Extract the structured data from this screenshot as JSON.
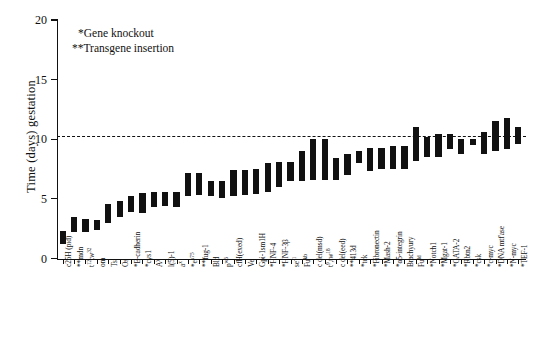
{
  "chart_data": {
    "type": "bar",
    "title": "",
    "xlabel": "",
    "ylabel": "Time (days) gestation",
    "ylim": [
      0,
      20
    ],
    "yticks": [
      0,
      5,
      10,
      15,
      20
    ],
    "grid": false,
    "legend_position": "upper-left-inside",
    "annotations": [
      "*Gene knockout",
      "**Transgene insertion"
    ],
    "reference_line": {
      "value": 10.3,
      "style": "dashed",
      "label": ""
    },
    "value_kind": "range",
    "note": "Each bar spans the earliest to latest reported day of gestational lethality for that mutation.",
    "categories": [
      "c25H (pid)",
      "**mdn",
      "t12tw32",
      "om",
      "Ts",
      "Os",
      "*E-cadherin",
      "*cys1",
      "Ay",
      "l(5)-1",
      "ax",
      "*ex75",
      "**fug-1",
      "Bld",
      "pw6",
      "cfH(exed)",
      "Ve",
      "Gpi-1sm1H",
      "*HNF-4",
      "*HNF-3b",
      "se-1",
      "Fukb",
      "c del(msd)",
      "t9,tw18",
      "c del(eed)",
      "**413d",
      "*tck",
      "*Fibronectin",
      "*Mash-2",
      "*a5-integrin",
      "Brachyury",
      "Fuld",
      "*Notch1",
      "*Mgat-1",
      "*GATA-2",
      "*Rbtn2",
      "*csk",
      "*c-myc",
      "*DNA mtf'ase",
      "*N-myc",
      "*TEF-1"
    ],
    "low": [
      1.2,
      2.2,
      2.2,
      2.4,
      3.0,
      3.5,
      3.9,
      3.8,
      4.3,
      4.4,
      4.3,
      5.2,
      5.3,
      5.2,
      5.1,
      5.2,
      5.3,
      5.4,
      5.6,
      6.0,
      6.5,
      6.5,
      6.6,
      6.6,
      6.6,
      7.0,
      8.0,
      7.3,
      7.5,
      7.5,
      7.5,
      8.2,
      8.5,
      8.5,
      9.2,
      8.8,
      9.5,
      8.8,
      9.0,
      9.2,
      9.6
    ],
    "high": [
      2.3,
      3.5,
      3.3,
      3.2,
      4.6,
      4.8,
      5.2,
      5.5,
      5.6,
      5.6,
      5.6,
      7.2,
      7.2,
      6.5,
      6.5,
      7.4,
      7.4,
      7.5,
      8.0,
      8.1,
      8.1,
      9.0,
      10.0,
      10.0,
      8.4,
      8.8,
      9.0,
      9.3,
      9.3,
      9.4,
      9.4,
      11.0,
      10.2,
      10.4,
      10.4,
      10.0,
      10.0,
      10.6,
      11.5,
      11.8,
      11.0
    ],
    "categories_display": [
      "c25H (pid)",
      "**mdn",
      "t<sup>12</sup>tw<sup>32</sup>",
      "om",
      "Ts",
      "Os",
      "*E-cadherin",
      "*cys1",
      "A<sup>y</sup>",
      "l(5)-1",
      "a<sup>x</sup>",
      "*e<sup>x75</sup>",
      "**fug-1",
      "Bld",
      "p<sup>w6</sup>",
      "cfH(exed)",
      "Ve",
      "Gpi-1sm1H",
      "*HNF-4",
      "*HNF-3&#946;",
      "se<sup>-1</sup>",
      "Fu<sup>kb</sup>",
      "c del(msd)",
      "t<sup>9</sup>,tw<sup>18</sup>",
      "c del(eed)",
      "**413d",
      "*tck",
      "*Fibronectin",
      "*Mash-2",
      "*&#945;5-integrin",
      "Brachyury",
      "Fu<sup>ld</sup>",
      "*Notch1",
      "*Mgat-1",
      "*GATA-2",
      "*Rbtn2",
      "*csk",
      "*c-myc",
      "*DNA mtf'ase",
      "*N-myc",
      "*TEF-1"
    ]
  },
  "axis": {
    "y_title": "Time (days) gestation",
    "y_tick_labels": [
      "0",
      "5",
      "10",
      "15",
      "20"
    ]
  },
  "colors": {
    "bar": "#111111",
    "axis": "#111111",
    "background": "#ffffff",
    "reference_line": "#111111"
  }
}
